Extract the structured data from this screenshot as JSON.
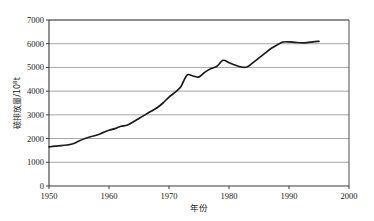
{
  "chart_data": {
    "type": "line",
    "title": "",
    "xlabel": "年份",
    "ylabel": "碳排放量/10⁸t",
    "ylabel_base": "碳排放量/10",
    "ylabel_exp": "8",
    "ylabel_unit": "t",
    "xlim": [
      1950,
      2000
    ],
    "ylim": [
      0,
      7000
    ],
    "grid": true,
    "legend": "none",
    "x_ticks": [
      1950,
      1960,
      1970,
      1980,
      1990,
      2000
    ],
    "x_tick_labels": [
      "1950",
      "1960",
      "1970",
      "1980",
      "1990",
      "2000"
    ],
    "y_ticks": [
      0,
      1000,
      2000,
      3000,
      4000,
      5000,
      6000,
      7000
    ],
    "y_tick_labels": [
      "0",
      "1000",
      "2000",
      "3000",
      "4000",
      "5000",
      "6000",
      "7000"
    ],
    "series": [
      {
        "name": "碳排放量",
        "color": "#1b1b1b",
        "x": [
          1950,
          1951,
          1952,
          1953,
          1954,
          1955,
          1956,
          1957,
          1958,
          1959,
          1960,
          1961,
          1962,
          1963,
          1964,
          1965,
          1966,
          1967,
          1968,
          1969,
          1970,
          1971,
          1972,
          1973,
          1974,
          1975,
          1976,
          1977,
          1978,
          1979,
          1980,
          1981,
          1982,
          1983,
          1984,
          1985,
          1986,
          1987,
          1988,
          1989,
          1990,
          1991,
          1992,
          1993,
          1994,
          1995
        ],
        "values": [
          1650,
          1680,
          1700,
          1730,
          1780,
          1900,
          2000,
          2080,
          2150,
          2250,
          2350,
          2420,
          2520,
          2560,
          2700,
          2850,
          3000,
          3150,
          3300,
          3500,
          3750,
          3950,
          4200,
          4680,
          4640,
          4600,
          4800,
          4950,
          5050,
          5300,
          5200,
          5100,
          5020,
          5020,
          5200,
          5400,
          5600,
          5800,
          5950,
          6070,
          6080,
          6060,
          6040,
          6050,
          6080,
          6100
        ]
      }
    ],
    "annotations": [
      {
        "label": "start-1950",
        "x": 1950,
        "y": 1650
      },
      {
        "label": "peak-1973",
        "x": 1973,
        "y": 4680
      },
      {
        "label": "dip-1975",
        "x": 1975,
        "y": 4600
      },
      {
        "label": "peak-1979",
        "x": 1979,
        "y": 5300
      },
      {
        "label": "trough-1983",
        "x": 1983,
        "y": 5020
      },
      {
        "label": "plateau-1990",
        "x": 1990,
        "y": 6080
      },
      {
        "label": "end-1995",
        "x": 1995,
        "y": 6100
      }
    ]
  },
  "plot": {
    "left": 49,
    "right": 349,
    "top": 20,
    "bottom": 186
  }
}
